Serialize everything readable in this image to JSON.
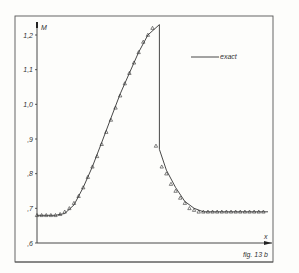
{
  "figure": {
    "caption": "fig. 13 b",
    "legend_label": "exact",
    "y_axis_label": "M",
    "x_axis_label": "x"
  },
  "chart_data": {
    "type": "line",
    "title": "",
    "xlabel": "x",
    "ylabel": "M",
    "caption": "fig. 13 b",
    "grid": false,
    "legend_position": "upper-right",
    "legend": [
      "exact"
    ],
    "y_ticks": [
      "1,2",
      "1,1",
      "1,0",
      ",9",
      ",8",
      ",7",
      ",6"
    ],
    "y_tick_values": [
      1.2,
      1.1,
      1.0,
      0.9,
      0.8,
      0.7,
      0.6
    ],
    "ylim": [
      0.6,
      1.25
    ],
    "xlim": [
      0,
      1
    ],
    "series": [
      {
        "name": "exact",
        "style": "solid line",
        "x": [
          0.0,
          0.08,
          0.12,
          0.16,
          0.2,
          0.24,
          0.28,
          0.32,
          0.36,
          0.4,
          0.44,
          0.48,
          0.5298,
          0.5298,
          0.56,
          0.6,
          0.64,
          0.68,
          0.72,
          1.0
        ],
        "values": [
          0.68,
          0.68,
          0.685,
          0.71,
          0.76,
          0.82,
          0.89,
          0.96,
          1.03,
          1.09,
          1.15,
          1.2,
          1.23,
          0.87,
          0.81,
          0.76,
          0.72,
          0.7,
          0.69,
          0.69
        ]
      },
      {
        "name": "numerical",
        "style": "triangle markers",
        "x": [
          0.0,
          0.02,
          0.04,
          0.06,
          0.08,
          0.1,
          0.12,
          0.14,
          0.16,
          0.18,
          0.2,
          0.22,
          0.24,
          0.26,
          0.28,
          0.3,
          0.32,
          0.34,
          0.36,
          0.38,
          0.4,
          0.42,
          0.44,
          0.46,
          0.48,
          0.5,
          0.515,
          0.54,
          0.56,
          0.58,
          0.6,
          0.62,
          0.64,
          0.66,
          0.68,
          0.7,
          0.72,
          0.74,
          0.76,
          0.78,
          0.8,
          0.82,
          0.84,
          0.86,
          0.88,
          0.9,
          0.92,
          0.94,
          0.96,
          0.98
        ],
        "values": [
          0.68,
          0.68,
          0.68,
          0.68,
          0.68,
          0.683,
          0.69,
          0.7,
          0.715,
          0.735,
          0.76,
          0.79,
          0.82,
          0.85,
          0.885,
          0.92,
          0.955,
          0.99,
          1.025,
          1.06,
          1.09,
          1.12,
          1.15,
          1.18,
          1.2,
          1.22,
          0.88,
          0.82,
          0.8,
          0.77,
          0.75,
          0.73,
          0.715,
          0.7,
          0.695,
          0.69,
          0.69,
          0.69,
          0.69,
          0.69,
          0.69,
          0.69,
          0.69,
          0.69,
          0.69,
          0.69,
          0.69,
          0.69,
          0.69,
          0.69
        ]
      }
    ]
  }
}
